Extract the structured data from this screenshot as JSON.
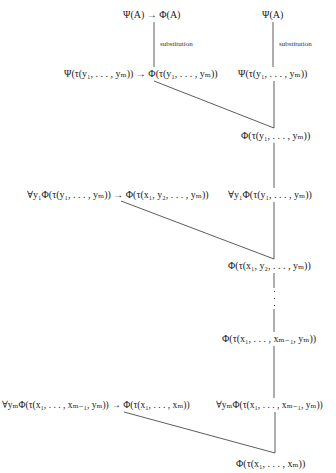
{
  "diagram": {
    "type": "proof-tree",
    "nodes": {
      "top_left": "Ψ(A) → Φ(A)",
      "top_right": "Ψ(A)",
      "subst_label_left": "substitution",
      "subst_label_right": "substitution",
      "row2_left": "Ψ(τ(y₁, . . . , yₘ)) → Φ(τ(y₁, . . . , yₘ))",
      "row2_right": "Ψ(τ(y₁, . . . , yₘ))",
      "result1": "Φ(τ(y₁, . . . , yₘ))",
      "row3_left": "∀y₁Φ(τ(y₁, . . . , yₘ)) → Φ(τ(x₁, y₂, . . . , yₘ))",
      "row3_right": "∀y₁Φ(τ(y₁, . . . , yₘ))",
      "result2": "Φ(τ(x₁, y₂, . . . , yₘ))",
      "ellipsis": "⋮",
      "result3": "Φ(τ(x₁, . . . , xₘ₋₁, yₘ))",
      "row4_left": "∀yₘΦ(τ(x₁, . . . , xₘ₋₁, yₘ)) → Φ(τ(x₁, . . . , xₘ))",
      "row4_right": "∀yₘΦ(τ(x₁, . . . , xₘ₋₁, yₘ))",
      "final": "Φ(τ(x₁, . . . , xₘ))"
    },
    "colors": {
      "line": "#333333",
      "text": "#1a1a1a",
      "background": "#ffffff"
    }
  }
}
